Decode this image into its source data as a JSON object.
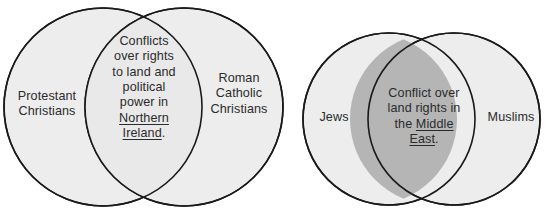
{
  "diagram": {
    "type": "venn-diagram-pair",
    "colors": {
      "circle_fill_light": "#ededed",
      "circle_fill_overlap_dark": "#b5b5b5",
      "circle_stroke": "#1a1a1a",
      "text": "#2b2b2b",
      "background": "#ffffff"
    },
    "left": {
      "name": "northern-ireland-venn",
      "left_circle_label": "Protestant\nChristians",
      "left_circle_label_lines": [
        "Protestant",
        "Christians"
      ],
      "right_circle_label_lines": [
        "Roman",
        "Catholic",
        "Christians"
      ],
      "overlap_label_lines": [
        "Conflicts",
        "over rights",
        "to land and",
        "political",
        "power in"
      ],
      "overlap_underlined_lines": [
        "Northern",
        "Ireland"
      ],
      "overlap_trailing_punctuation": ".",
      "overlap_full_text": "Conflicts over rights to land and political power in Northern Ireland."
    },
    "right": {
      "name": "middle-east-venn",
      "left_circle_label": "Jews",
      "right_circle_label": "Muslims",
      "overlap_line_1": "Conflict over",
      "overlap_line_2": "land rights in",
      "overlap_line_3_prefix": "the ",
      "overlap_line_3_underlined": "Middle",
      "overlap_line_4_underlined": "East",
      "overlap_trailing_punctuation": ".",
      "overlap_full_text": "Conflict over land rights in the Middle East."
    }
  }
}
